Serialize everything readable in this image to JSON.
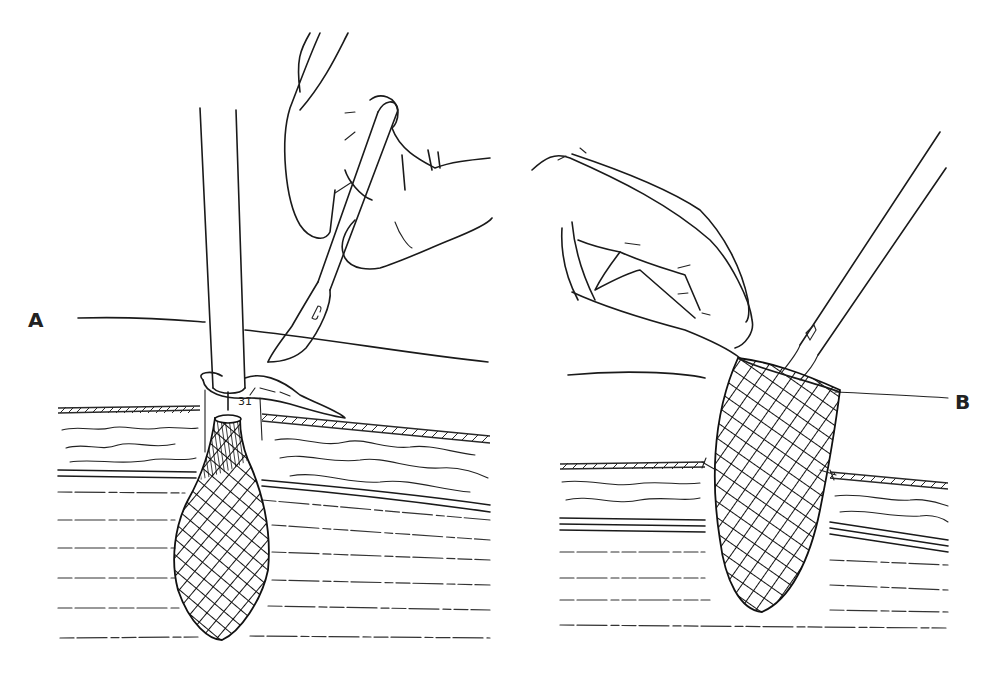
{
  "figure": {
    "type": "surgical line illustration",
    "panels": [
      {
        "id": "A",
        "label": "A",
        "elements": [
          "gloved-hand",
          "scalpel",
          "tubular-introducer",
          "skin-flap",
          "tissue-layers",
          "mesh-plug"
        ]
      },
      {
        "id": "B",
        "label": "B",
        "elements": [
          "gloved-hand",
          "forceps",
          "mesh-plug",
          "tissue-layers",
          "suture"
        ]
      }
    ],
    "colors": {
      "background": "#ffffff",
      "ink": "#1a1a1a"
    }
  }
}
